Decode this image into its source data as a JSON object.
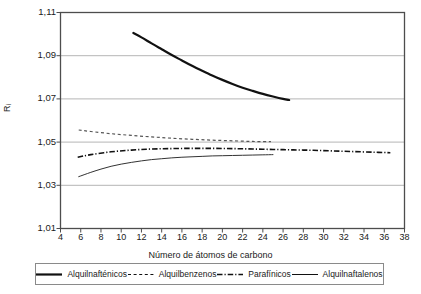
{
  "chart_data": {
    "type": "line",
    "title": "",
    "xlabel": "Número de átomos de carbono",
    "ylabel": "Ri",
    "xlim": [
      4,
      38
    ],
    "ylim": [
      1.01,
      1.11
    ],
    "xticks": [
      4,
      6,
      8,
      10,
      12,
      14,
      16,
      18,
      20,
      22,
      24,
      26,
      28,
      30,
      32,
      34,
      36,
      38
    ],
    "yticks": [
      "1,01",
      "1,03",
      "1,05",
      "1,07",
      "1,09",
      "1,11"
    ],
    "ytick_values": [
      1.01,
      1.03,
      1.05,
      1.07,
      1.09,
      1.11
    ],
    "grid": "horizontal",
    "legend_position": "bottom",
    "series": [
      {
        "name": "Alquilnafténicos",
        "style": "solid",
        "width": 2.2,
        "color": "#111111",
        "x": [
          11.2,
          12,
          13,
          14,
          15,
          16,
          17,
          18,
          19,
          20,
          21,
          22,
          23,
          24,
          25,
          26,
          26.6
        ],
        "y": [
          1.1005,
          1.0985,
          1.0957,
          1.093,
          1.0903,
          1.0878,
          1.0853,
          1.083,
          1.0808,
          1.0788,
          1.0769,
          1.0752,
          1.0737,
          1.0723,
          1.0711,
          1.07,
          1.0695
        ]
      },
      {
        "name": "Alquilbenzenos",
        "style": "dashed",
        "width": 1.2,
        "color": "#555555",
        "x": [
          5.8,
          7,
          9,
          11,
          13,
          15,
          17,
          19,
          21,
          23,
          24.8
        ],
        "y": [
          1.0556,
          1.0549,
          1.0539,
          1.0531,
          1.0524,
          1.0518,
          1.0513,
          1.0509,
          1.0506,
          1.0503,
          1.0502
        ]
      },
      {
        "name": "Parafínicos",
        "style": "dashdot",
        "width": 1.6,
        "color": "#111111",
        "x": [
          5.7,
          7,
          9,
          11,
          13,
          15,
          17,
          19,
          21,
          23,
          25,
          27,
          29,
          31,
          33,
          35,
          36.6
        ],
        "y": [
          1.043,
          1.0442,
          1.0455,
          1.0463,
          1.0468,
          1.047,
          1.0471,
          1.0471,
          1.047,
          1.0468,
          1.0466,
          1.0464,
          1.0462,
          1.0459,
          1.0456,
          1.0453,
          1.0451
        ]
      },
      {
        "name": "Alquilnaftalenos",
        "style": "solid",
        "width": 1.0,
        "color": "#333333",
        "x": [
          5.8,
          7,
          8,
          9,
          10,
          11,
          12,
          13,
          14,
          15,
          16,
          17,
          18,
          19,
          20,
          21,
          22,
          23,
          24,
          25
        ],
        "y": [
          1.034,
          1.036,
          1.0375,
          1.0388,
          1.0398,
          1.0406,
          1.0413,
          1.0419,
          1.0423,
          1.0427,
          1.043,
          1.0432,
          1.0434,
          1.0436,
          1.0437,
          1.0438,
          1.0439,
          1.044,
          1.0441,
          1.0442
        ]
      }
    ]
  },
  "legend": {
    "items": [
      {
        "label": "Alquilnafténicos",
        "style": "solid",
        "width": 2.2
      },
      {
        "label": "Alquilbenzenos",
        "style": "dashed",
        "width": 1.2
      },
      {
        "label": "Parafínicos",
        "style": "dashdot",
        "width": 1.6
      },
      {
        "label": "Alquilnaftalenos",
        "style": "solid",
        "width": 1.0
      }
    ]
  },
  "axes": {
    "y_label_main": "R",
    "y_label_sub": "i",
    "x_label": "Número de átomos de carbono"
  },
  "colors": {
    "frame": "#4d4d4d",
    "grid": "#b5b5b5",
    "ink": "#1a1a1a",
    "background": "#ffffff"
  }
}
